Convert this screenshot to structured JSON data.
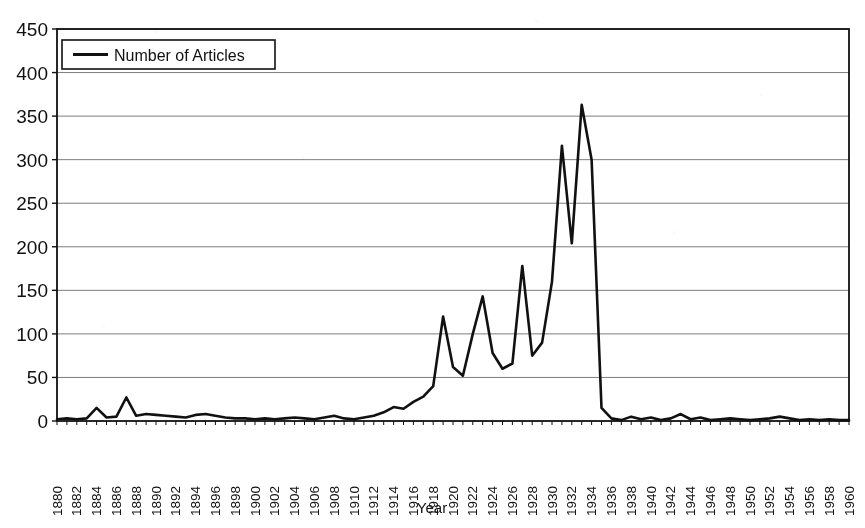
{
  "chart_data": {
    "type": "line",
    "title": "",
    "xlabel": "Year",
    "ylabel": "",
    "ylim": [
      0,
      450
    ],
    "ytick_step": 50,
    "yticks": [
      "0",
      "50",
      "100",
      "150",
      "200",
      "250",
      "300",
      "350",
      "400",
      "450"
    ],
    "xlim": [
      1880,
      1960
    ],
    "xtick_step": 2,
    "grid": "horizontal",
    "legend_position": "top-left-inside",
    "legend": [
      "Number of Articles"
    ],
    "line_color": "#111111",
    "series": [
      {
        "name": "Number of Articles",
        "values": [
          2,
          3,
          2,
          3,
          15,
          4,
          5,
          27,
          6,
          8,
          7,
          6,
          5,
          4,
          7,
          8,
          6,
          4,
          3,
          3,
          2,
          3,
          2,
          3,
          4,
          3,
          2,
          4,
          6,
          3,
          2,
          4,
          6,
          10,
          16,
          14,
          22,
          28,
          40,
          120,
          62,
          52,
          100,
          143,
          78,
          60,
          66,
          178,
          75,
          90,
          160,
          316,
          204,
          363,
          300,
          15,
          3,
          1,
          5,
          2,
          4,
          1,
          3,
          8,
          2,
          4,
          1,
          2,
          3,
          2,
          1,
          2,
          3,
          5,
          3,
          1,
          2,
          1,
          2,
          1,
          1
        ]
      }
    ],
    "x": [
      1880,
      1881,
      1882,
      1883,
      1884,
      1885,
      1886,
      1887,
      1888,
      1889,
      1890,
      1891,
      1892,
      1893,
      1894,
      1895,
      1896,
      1897,
      1898,
      1899,
      1900,
      1901,
      1902,
      1903,
      1904,
      1905,
      1906,
      1907,
      1908,
      1909,
      1910,
      1911,
      1912,
      1913,
      1914,
      1915,
      1916,
      1917,
      1918,
      1919,
      1920,
      1921,
      1922,
      1923,
      1924,
      1925,
      1926,
      1927,
      1928,
      1929,
      1930,
      1931,
      1932,
      1933,
      1934,
      1935,
      1936,
      1937,
      1938,
      1939,
      1940,
      1941,
      1942,
      1943,
      1944,
      1945,
      1946,
      1947,
      1948,
      1949,
      1950,
      1951,
      1952,
      1953,
      1954,
      1955,
      1956,
      1957,
      1958,
      1959,
      1960
    ],
    "xtick_labels": [
      "1880",
      "1882",
      "1884",
      "1886",
      "1888",
      "1890",
      "1892",
      "1894",
      "1896",
      "1898",
      "1900",
      "1902",
      "1904",
      "1906",
      "1908",
      "1910",
      "1912",
      "1914",
      "1916",
      "1918",
      "1920",
      "1922",
      "1924",
      "1926",
      "1928",
      "1930",
      "1932",
      "1934",
      "1936",
      "1938",
      "1940",
      "1942",
      "1944",
      "1946",
      "1948",
      "1950",
      "1952",
      "1954",
      "1956",
      "1958",
      "1960"
    ]
  }
}
